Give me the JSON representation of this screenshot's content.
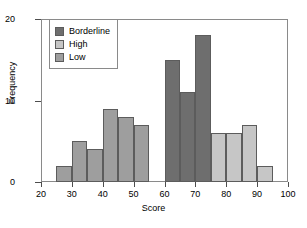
{
  "chart_data": {
    "type": "bar",
    "title": "",
    "xlabel": "Score",
    "ylabel": "Frequency",
    "xlim": [
      20,
      100
    ],
    "ylim": [
      0,
      20
    ],
    "xticks": [
      20,
      30,
      40,
      50,
      60,
      70,
      80,
      90,
      100
    ],
    "yticks": [
      0,
      10,
      20
    ],
    "grid": false,
    "legend_position": "upper-left",
    "bin_width": 5,
    "legend": [
      {
        "label": "Borderline",
        "color": "#6e6e6e"
      },
      {
        "label": "High",
        "color": "#c6c6c6"
      },
      {
        "label": "Low",
        "color": "#9e9e9e"
      }
    ],
    "bars": [
      {
        "x0": 25,
        "x1": 30,
        "value": 2,
        "series": "Low",
        "color": "#9e9e9e"
      },
      {
        "x0": 30,
        "x1": 35,
        "value": 5,
        "series": "Low",
        "color": "#9e9e9e"
      },
      {
        "x0": 35,
        "x1": 40,
        "value": 4,
        "series": "Low",
        "color": "#9e9e9e"
      },
      {
        "x0": 40,
        "x1": 45,
        "value": 9,
        "series": "Low",
        "color": "#9e9e9e"
      },
      {
        "x0": 45,
        "x1": 50,
        "value": 8,
        "series": "Low",
        "color": "#9e9e9e"
      },
      {
        "x0": 50,
        "x1": 55,
        "value": 7,
        "series": "Low",
        "color": "#9e9e9e"
      },
      {
        "x0": 60,
        "x1": 65,
        "value": 15,
        "series": "Borderline",
        "color": "#6e6e6e"
      },
      {
        "x0": 65,
        "x1": 70,
        "value": 11,
        "series": "Borderline",
        "color": "#6e6e6e"
      },
      {
        "x0": 70,
        "x1": 75,
        "value": 18,
        "series": "Borderline",
        "color": "#6e6e6e"
      },
      {
        "x0": 75,
        "x1": 80,
        "value": 6,
        "series": "High",
        "color": "#c6c6c6"
      },
      {
        "x0": 80,
        "x1": 85,
        "value": 6,
        "series": "High",
        "color": "#c6c6c6"
      },
      {
        "x0": 85,
        "x1": 90,
        "value": 7,
        "series": "High",
        "color": "#c6c6c6"
      },
      {
        "x0": 90,
        "x1": 95,
        "value": 2,
        "series": "High",
        "color": "#c6c6c6"
      }
    ],
    "series": [
      {
        "name": "Borderline",
        "categories": [
          60,
          65,
          70
        ],
        "values": [
          15,
          11,
          18
        ]
      },
      {
        "name": "High",
        "categories": [
          75,
          80,
          85,
          90
        ],
        "values": [
          6,
          6,
          7,
          2
        ]
      },
      {
        "name": "Low",
        "categories": [
          25,
          30,
          35,
          40,
          45,
          50
        ],
        "values": [
          2,
          5,
          4,
          9,
          8,
          7
        ]
      }
    ]
  }
}
